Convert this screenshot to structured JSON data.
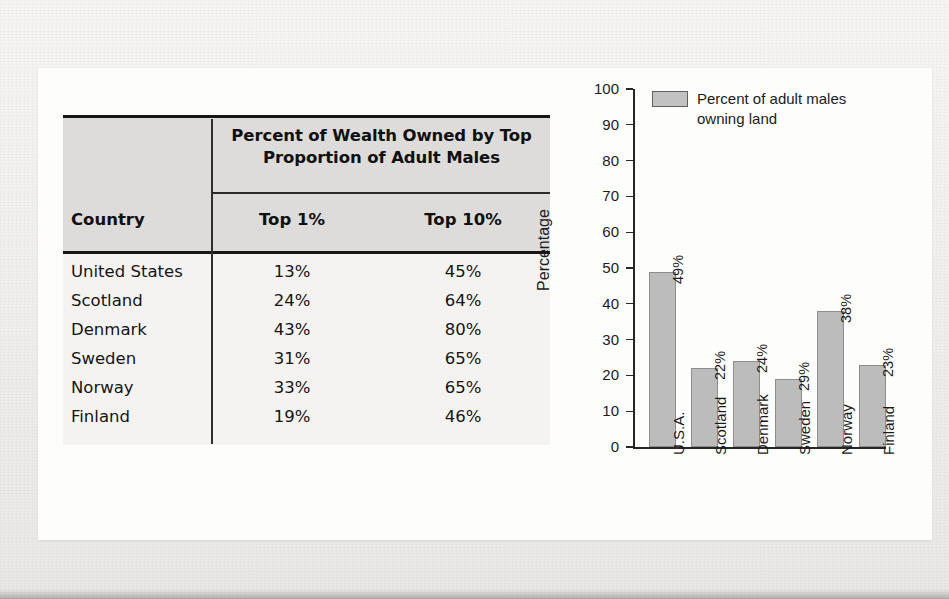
{
  "figure": {
    "table": {
      "spanning_header": "Percent of Wealth Owned by\nTop Proportion of Adult Males",
      "country_header": "Country",
      "columns": [
        "Top 1%",
        "Top 10%"
      ],
      "rows": [
        {
          "country": "United States",
          "top1": "13%",
          "top10": "45%"
        },
        {
          "country": "Scotland",
          "top1": "24%",
          "top10": "64%"
        },
        {
          "country": "Denmark",
          "top1": "43%",
          "top10": "80%"
        },
        {
          "country": "Sweden",
          "top1": "31%",
          "top10": "65%"
        },
        {
          "country": "Norway",
          "top1": "33%",
          "top10": "65%"
        },
        {
          "country": "Finland",
          "top1": "19%",
          "top10": "46%"
        }
      ]
    }
  },
  "chart_data": {
    "type": "bar",
    "title": "",
    "xlabel": "",
    "ylabel": "Percentage",
    "ylim": [
      0,
      100
    ],
    "yticks": [
      0,
      10,
      20,
      30,
      40,
      50,
      60,
      70,
      80,
      90,
      100
    ],
    "ytick_labels": [
      "0",
      "10",
      "20",
      "30",
      "40",
      "50",
      "60",
      "70",
      "80",
      "90",
      "100"
    ],
    "grid": false,
    "legend_position": "top-left",
    "legend": [
      "Percent of adult males\nowning land"
    ],
    "categories": [
      "U.S.A.",
      "Scotland",
      "Denmark",
      "Sweden",
      "Norway",
      "Finland"
    ],
    "values": [
      49,
      22,
      24,
      19,
      38,
      23
    ],
    "data_labels": [
      "49%",
      "22%",
      "24%",
      "29%",
      "38%",
      "23%"
    ],
    "series": [
      {
        "name": "Percent of adult males owning land",
        "values": [
          49,
          22,
          24,
          19,
          38,
          23
        ],
        "color": "#bcbcbc"
      }
    ]
  },
  "colors": {
    "bar_fill": "#bcbcbc",
    "bar_edge": "#8d8d8d",
    "axis": "#262626",
    "table_header_bg": "#dddcda",
    "table_body_bg": "#f4f3f1",
    "rule": "#161616",
    "paper": "#fdfdfc"
  }
}
